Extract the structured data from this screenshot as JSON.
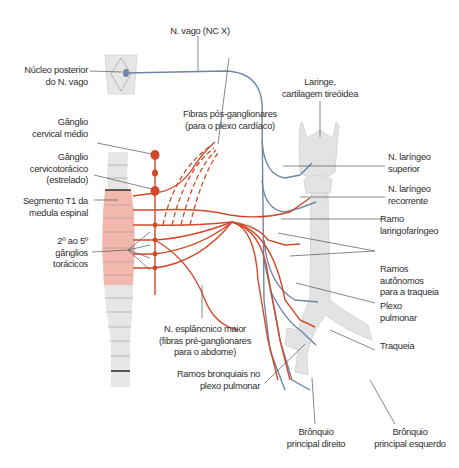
{
  "figure": {
    "colors": {
      "sympathetic": "#d2492a",
      "parasympathetic": "#6f86a8",
      "spinal_cord_thoracic": "#f2b8ad",
      "spinal_cord_other": "#e6e6e6",
      "organ_fill": "#e3e3e3",
      "leader_line": "#555555"
    },
    "labels": {
      "vagus": "N. vago (NC X)",
      "nucleus_line1": "Núcleo posterior",
      "nucleus_line2": "do N. vago",
      "larynx_line1": "Laringe,",
      "larynx_line2": "cartilagem tireóidea",
      "postganglionic_line1": "Fibras pós-ganglionares",
      "postganglionic_line2": "(para o plexo cardíaco)",
      "middle_cervical_line1": "Gânglio",
      "middle_cervical_line2": "cervical médio",
      "cervicothoracic_line1": "Gânglio",
      "cervicothoracic_line2": "cervicotorácico",
      "cervicothoracic_line3": "(estrelado)",
      "t1_line1": "Segmento T1 da",
      "t1_line2": "medula espinal",
      "thoracic_ganglia_line1": "2º ao 5º",
      "thoracic_ganglia_line2": "gânglios",
      "thoracic_ganglia_line3": "torácicos",
      "sup_laryngeal_line1": "N. laríngeo",
      "sup_laryngeal_line2": "superior",
      "rec_laryngeal_line1": "N. laríngeo",
      "rec_laryngeal_line2": "recorrente",
      "laryngopharyngeal_line1": "Ramo",
      "laryngopharyngeal_line2": "laringofaríngeo",
      "autonomic_line1": "Ramos",
      "autonomic_line2": "autônomos",
      "autonomic_line3": "para a traqueia",
      "pulmonary_plexus_line1": "Plexo",
      "pulmonary_plexus_line2": "pulmonar",
      "trachea": "Traqueia",
      "splanchnic_line1": "N. esplâncnico maior",
      "splanchnic_line2": "(fibras pré-ganglionares",
      "splanchnic_line3": "para o abdome)",
      "bronchial_line1": "Ramos bronquiais no",
      "bronchial_line2": "plexo pulmonar",
      "right_bronchus_line1": "Brônquio",
      "right_bronchus_line2": "principal direito",
      "left_bronchus_line1": "Brônquio",
      "left_bronchus_line2": "principal esquerdo"
    }
  }
}
